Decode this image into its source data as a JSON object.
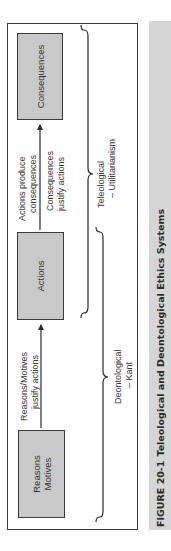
{
  "diagram": {
    "boxes": [
      {
        "id": "reasons",
        "lines": [
          "Reasons",
          "Motives"
        ]
      },
      {
        "id": "actions",
        "label": "Actions"
      },
      {
        "id": "consequences",
        "label": "Consequences"
      }
    ],
    "arrows": [
      {
        "from": "reasons",
        "to": "actions",
        "above": [
          "Reasons/Motives",
          "justify actions"
        ]
      },
      {
        "from": "actions",
        "to": "consequences",
        "above": [
          "Actions produce",
          "consequences"
        ],
        "below": [
          "Consequences",
          "justify actions"
        ]
      }
    ],
    "groups": [
      {
        "id": "deontological",
        "lines": [
          "Deontological",
          "– Kant"
        ],
        "spans": [
          "reasons",
          "actions"
        ]
      },
      {
        "id": "teleological",
        "lines": [
          "Teleological",
          "– Utilitarianism"
        ],
        "spans": [
          "actions",
          "consequences"
        ]
      }
    ],
    "colors": {
      "box_fill": "#c9c9c9",
      "stroke": "#3a3a3a",
      "caption_band": "#d6d6d6"
    }
  },
  "caption": {
    "figure_number": "FIGURE 20-1",
    "title": "Teleological and Deontological Ethics Systems"
  }
}
